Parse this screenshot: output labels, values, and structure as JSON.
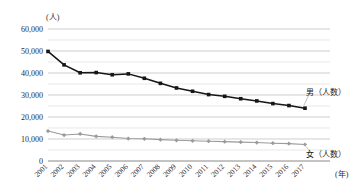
{
  "chart_data": {
    "type": "line",
    "title": "",
    "xlabel": "(年)",
    "ylabel": "(人)",
    "ylim": [
      0,
      60000
    ],
    "grid": true,
    "grid_major_step": 10000,
    "grid_minor_step": 5000,
    "legend_position": "right-inline",
    "categories": [
      "2001",
      "2002",
      "2003",
      "2004",
      "2005",
      "2006",
      "2007",
      "2008",
      "2009",
      "2010",
      "2011",
      "2012",
      "2013",
      "2014",
      "2015",
      "2016",
      "2017"
    ],
    "ytick_labels": [
      "0",
      "10,000",
      "20,000",
      "30,000",
      "40,000",
      "50,000",
      "60,000"
    ],
    "ytick_values": [
      0,
      10000,
      20000,
      30000,
      40000,
      50000,
      60000
    ],
    "series": [
      {
        "name": "男（人数）",
        "color": "#161616",
        "marker": "square",
        "values": [
          49800,
          43700,
          40100,
          40200,
          39200,
          39600,
          37600,
          35300,
          33200,
          31700,
          30200,
          29400,
          28300,
          27300,
          26100,
          25200,
          24000
        ]
      },
      {
        "name": "女（人数）",
        "color": "#9a9a9a",
        "marker": "diamond",
        "values": [
          13600,
          11800,
          12300,
          11200,
          10800,
          10200,
          10100,
          9700,
          9400,
          9200,
          9000,
          8800,
          8600,
          8400,
          8100,
          7900,
          7500
        ]
      }
    ],
    "annotations": {
      "unit_y": "(人)",
      "unit_x": "(年)",
      "male_label": "男（人数）",
      "female_label": "女（人数）"
    }
  }
}
